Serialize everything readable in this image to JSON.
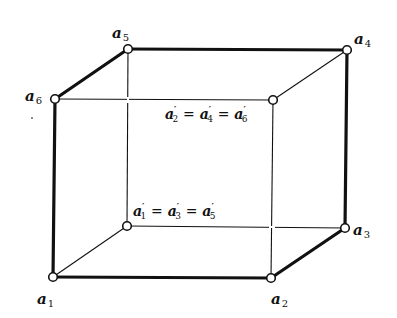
{
  "diagram": {
    "type": "cube-projection",
    "colors": {
      "stroke": "#111111",
      "background": "#ffffff",
      "vertex_fill": "#ffffff"
    },
    "vertices": [
      {
        "id": "a1",
        "letter": "a",
        "sub": "1",
        "x": 53,
        "y": 277
      },
      {
        "id": "a2",
        "letter": "a",
        "sub": "2",
        "x": 271,
        "y": 278
      },
      {
        "id": "a3",
        "letter": "a",
        "sub": "3",
        "x": 345,
        "y": 228
      },
      {
        "id": "a4",
        "letter": "a",
        "sub": "4",
        "x": 347,
        "y": 50
      },
      {
        "id": "a5",
        "letter": "a",
        "sub": "5",
        "x": 128,
        "y": 49
      },
      {
        "id": "a6",
        "letter": "a",
        "sub": "6",
        "x": 55,
        "y": 99
      },
      {
        "id": "p246",
        "x": 273,
        "y": 100
      },
      {
        "id": "p135",
        "x": 127,
        "y": 226
      }
    ],
    "thick_edges": [
      [
        "a1",
        "a2"
      ],
      [
        "a2",
        "a3"
      ],
      [
        "a3",
        "a4"
      ],
      [
        "a4",
        "a5"
      ],
      [
        "a5",
        "a6"
      ],
      [
        "a6",
        "a1"
      ]
    ],
    "thin_edges": [
      [
        "a6",
        "p246"
      ],
      [
        "p246",
        "a4"
      ],
      [
        "p246",
        "a2"
      ],
      [
        "a5",
        "p135"
      ],
      [
        "p135",
        "a1"
      ],
      [
        "p135",
        "a3"
      ]
    ],
    "labels": {
      "a1": {
        "letter": "a",
        "sub": "1"
      },
      "a2": {
        "letter": "a",
        "sub": "2"
      },
      "a3": {
        "letter": "a",
        "sub": "3"
      },
      "a4": {
        "letter": "a",
        "sub": "4"
      },
      "a5": {
        "letter": "a",
        "sub": "5"
      },
      "a6": {
        "letter": "a",
        "sub": "6"
      },
      "upper_eq": {
        "t1": "a",
        "s1": "2",
        "t2": "a",
        "s2": "4",
        "t3": "a",
        "s3": "6",
        "prime": "′",
        "eq": "="
      },
      "lower_eq": {
        "t1": "a",
        "s1": "1",
        "t2": "a",
        "s2": "3",
        "t3": "a",
        "s3": "5",
        "prime": "′",
        "eq": "="
      }
    }
  }
}
